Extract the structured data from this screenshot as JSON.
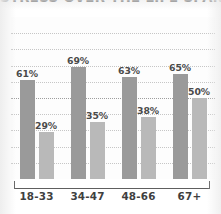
{
  "chart_data": {
    "type": "bar",
    "title": "STRESS OVER THE LIFE SPAN",
    "xlabel": "",
    "ylabel": "",
    "ylim": [
      0,
      100
    ],
    "grid": true,
    "gridlines": 9,
    "legend": "none",
    "categories": [
      "18-33",
      "34-47",
      "48-66",
      "67+"
    ],
    "series": [
      {
        "name": "series-1",
        "color": "#9a9a9a",
        "values": [
          61,
          69,
          63,
          65
        ],
        "labels": [
          "61%",
          "69%",
          "63%",
          "65%"
        ]
      },
      {
        "name": "series-2",
        "color": "#b9b9b9",
        "values": [
          29,
          35,
          38,
          50
        ],
        "labels": [
          "29%",
          "35%",
          "38%",
          "50%"
        ]
      }
    ]
  },
  "axis": {
    "tick_labels": [
      "18-33",
      "34-47",
      "48-66",
      "67+"
    ]
  },
  "colors": {
    "series_1": "#9a9a9a",
    "series_2": "#b9b9b9",
    "gridline": "#c6c6c6",
    "axis": "#5e5e5e",
    "label_text": "#4a4a4a",
    "title_text": "#3a3a3a",
    "background": "#ffffff"
  }
}
